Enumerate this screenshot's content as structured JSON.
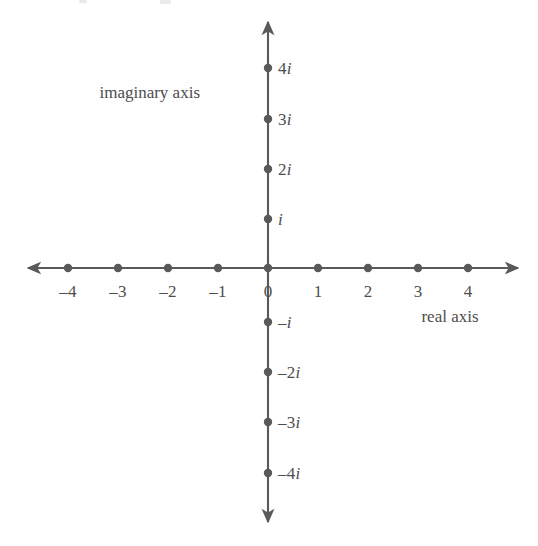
{
  "figure": {
    "kind": "complex-plane",
    "background_color": "#ffffff",
    "ink_color": "#595959",
    "text_color": "#4d4d4d"
  },
  "axes": {
    "real": {
      "title": "real axis",
      "title_x": 450,
      "title_y": 316,
      "y": 268,
      "x_start": 28,
      "x_end": 518,
      "arrow_both_ends": true
    },
    "imaginary": {
      "title": "imaginary axis",
      "title_x": 200,
      "title_y": 92,
      "x": 268,
      "y_start": 22,
      "y_end": 522,
      "arrow_both_ends": true
    }
  },
  "origin": {
    "x": 268,
    "y": 268
  },
  "spacing": {
    "x": 50,
    "y": 50
  },
  "dot_radius": 4.2,
  "chart_data": {
    "type": "scatter",
    "title": "",
    "xlabel": "real axis",
    "ylabel": "imaginary axis",
    "xlim": [
      -4.8,
      5.0
    ],
    "ylim": [
      -5.0,
      4.9
    ],
    "grid": false,
    "legend": null,
    "real_ticks": [
      {
        "value": -4,
        "label": "–4",
        "x": 68
      },
      {
        "value": -3,
        "label": "–3",
        "x": 118
      },
      {
        "value": -2,
        "label": "–2",
        "x": 168
      },
      {
        "value": -1,
        "label": "–1",
        "x": 218
      },
      {
        "value": 0,
        "label": "0",
        "x": 268
      },
      {
        "value": 1,
        "label": "1",
        "x": 318
      },
      {
        "value": 2,
        "label": "2",
        "x": 368
      },
      {
        "value": 3,
        "label": "3",
        "x": 418
      },
      {
        "value": 4,
        "label": "4",
        "x": 468
      }
    ],
    "imaginary_ticks": [
      {
        "value": 4,
        "prefix": "4",
        "unit": "i",
        "label": "4i",
        "y": 68
      },
      {
        "value": 3,
        "prefix": "3",
        "unit": "i",
        "label": "3i",
        "y": 119
      },
      {
        "value": 2,
        "prefix": "2",
        "unit": "i",
        "label": "2i",
        "y": 169
      },
      {
        "value": 1,
        "prefix": "",
        "unit": "i",
        "label": "i",
        "y": 219
      },
      {
        "value": -1,
        "prefix": "–",
        "unit": "i",
        "label": "–i",
        "y": 322
      },
      {
        "value": -2,
        "prefix": "–2",
        "unit": "i",
        "label": "–2i",
        "y": 372
      },
      {
        "value": -3,
        "prefix": "–3",
        "unit": "i",
        "label": "–3i",
        "y": 422
      },
      {
        "value": -4,
        "prefix": "–4",
        "unit": "i",
        "label": "–4i",
        "y": 473
      }
    ],
    "real_points": [
      {
        "x": -4,
        "y": 0,
        "px": 68,
        "py": 268
      },
      {
        "x": -3,
        "y": 0,
        "px": 118,
        "py": 268
      },
      {
        "x": -2,
        "y": 0,
        "px": 168,
        "py": 268
      },
      {
        "x": -1,
        "y": 0,
        "px": 218,
        "py": 268
      },
      {
        "x": 0,
        "y": 0,
        "px": 268,
        "py": 268
      },
      {
        "x": 1,
        "y": 0,
        "px": 318,
        "py": 268
      },
      {
        "x": 2,
        "y": 0,
        "px": 368,
        "py": 268
      },
      {
        "x": 3,
        "y": 0,
        "px": 418,
        "py": 268
      },
      {
        "x": 4,
        "y": 0,
        "px": 468,
        "py": 268
      }
    ],
    "imaginary_points": [
      {
        "x": 0,
        "y": 4,
        "px": 268,
        "py": 68
      },
      {
        "x": 0,
        "y": 3,
        "px": 268,
        "py": 119
      },
      {
        "x": 0,
        "y": 2,
        "px": 268,
        "py": 169
      },
      {
        "x": 0,
        "y": 1,
        "px": 268,
        "py": 219
      },
      {
        "x": 0,
        "y": -1,
        "px": 268,
        "py": 322
      },
      {
        "x": 0,
        "y": -2,
        "px": 268,
        "py": 372
      },
      {
        "x": 0,
        "y": -3,
        "px": 268,
        "py": 422
      },
      {
        "x": 0,
        "y": -4,
        "px": 268,
        "py": 473
      }
    ]
  }
}
